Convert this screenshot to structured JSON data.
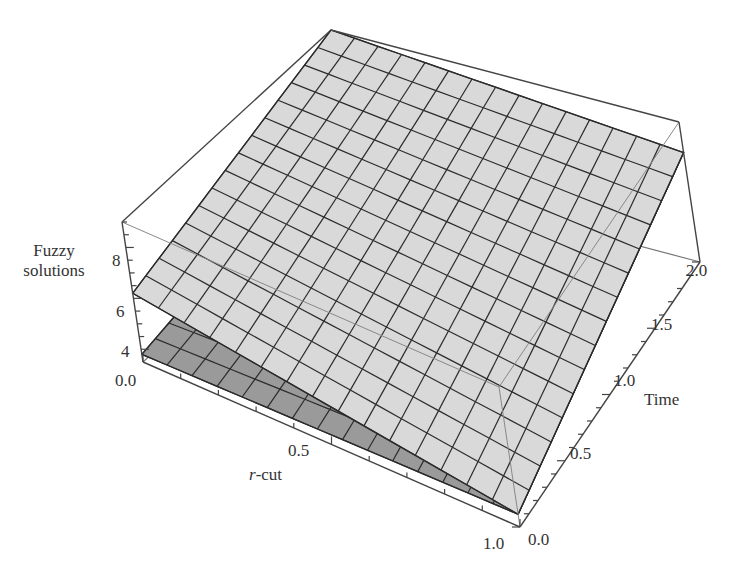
{
  "chart_data": {
    "type": "surface3d",
    "title": "",
    "xlabel": "r-cut",
    "ylabel": "Time",
    "zlabel": "Fuzzy solutions",
    "x_ticks": [
      "0.0",
      "0.5",
      "1.0"
    ],
    "y_ticks": [
      "0.0",
      "0.5",
      "1.0",
      "1.5",
      "2.0"
    ],
    "z_ticks": [
      "4",
      "6",
      "8"
    ],
    "xlim": [
      0,
      1
    ],
    "ylim": [
      0,
      2
    ],
    "zlim": [
      3.5,
      9
    ],
    "grid_mesh": "15x15",
    "series": [
      {
        "name": "upper fuzzy solution",
        "color": "#d9d9d9",
        "corners": {
          "r0_t0": 6.2,
          "r1_t0": 4.0,
          "r0_t2": 9.0,
          "r1_t2": 7.8
        }
      },
      {
        "name": "lower fuzzy solution",
        "color": "#9a9a9a",
        "corners": {
          "r0_t0": 3.8,
          "r1_t0": 4.0,
          "r0_t2": 5.5,
          "r1_t2": 7.8
        }
      }
    ]
  },
  "labels": {
    "z_title_line1": "Fuzzy",
    "z_title_line2": "solutions",
    "x_title_prefix": "r",
    "x_title_suffix": "-cut",
    "y_title": "Time",
    "z_tick_8": "8",
    "z_tick_6": "6",
    "z_tick_4": "4",
    "x_tick_0": "0.0",
    "x_tick_05": "0.5",
    "x_tick_1": "1.0",
    "y_tick_0": "0.0",
    "y_tick_05": "0.5",
    "y_tick_1": "1.0",
    "y_tick_15": "1.5",
    "y_tick_2": "2.0"
  },
  "colors": {
    "upper_surface": "#d9d9d9",
    "lower_surface": "#9a9a9a",
    "mesh": "#2b2b2b",
    "box": "#444444"
  }
}
